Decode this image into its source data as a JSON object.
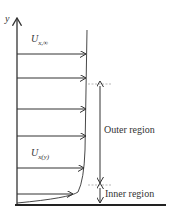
{
  "diagram": {
    "axis_label": "y",
    "free_stream_label": "U",
    "free_stream_sub": "x,∞",
    "local_label": "U",
    "local_sub": "x(y)",
    "outer_region_label": "Outer region",
    "inner_region_label": "Inner region",
    "colors": {
      "line": "#333333",
      "dashed": "#999999",
      "background": "#ffffff"
    }
  }
}
